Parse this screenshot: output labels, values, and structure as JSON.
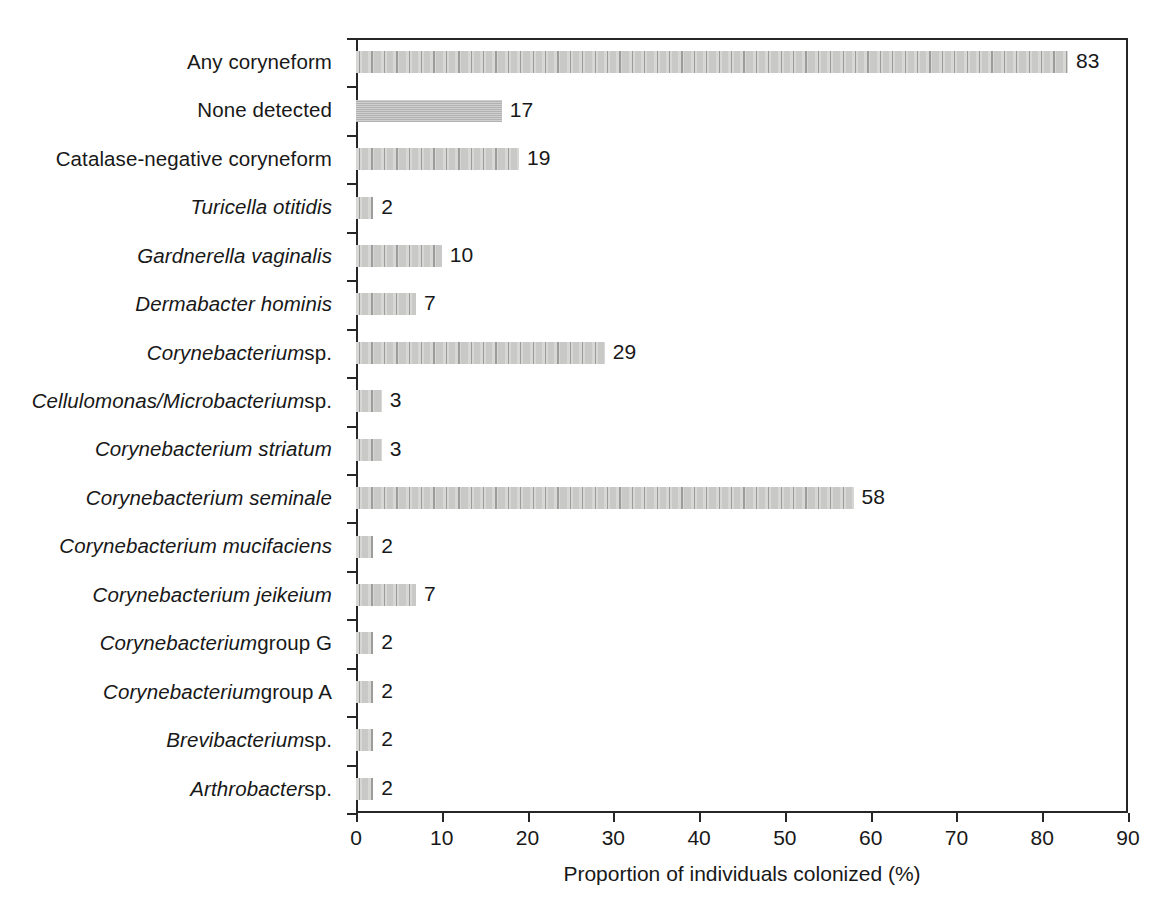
{
  "chart_data": {
    "type": "bar",
    "orientation": "horizontal",
    "title": "",
    "xlabel": "Proportion of individuals colonized (%)",
    "ylabel": "",
    "xlim": [
      0,
      90
    ],
    "xticks": [
      0,
      10,
      20,
      30,
      40,
      50,
      60,
      70,
      80,
      90
    ],
    "xtick_labels": [
      "0",
      "10",
      "20",
      "30",
      "40",
      "50",
      "60",
      "70",
      "80",
      "90"
    ],
    "grid": false,
    "legend": null,
    "bar_fill_color": "#c9c9c9",
    "bar_edge_color": "#8a8a8a",
    "axis_color": "#262626",
    "categories": [
      "Any coryneform",
      "None detected",
      "Catalase-negative coryneform",
      "Turicella otitidis",
      "Gardnerella vaginalis",
      "Dermabacter hominis",
      "Corynebacterium sp.",
      "Cellulomonas/Microbacterium sp.",
      "Corynebacterium striatum",
      "Corynebacterium seminale",
      "Corynebacterium mucifaciens",
      "Corynebacterium jeikeium",
      "Corynebacterium group G",
      "Corynebacterium group A",
      "Brevibacterium sp.",
      "Arthrobacter sp."
    ],
    "values": [
      83,
      17,
      19,
      2,
      10,
      7,
      29,
      3,
      3,
      58,
      2,
      7,
      2,
      2,
      2,
      2
    ],
    "value_labels": [
      "83",
      "17",
      "19",
      "2",
      "10",
      "7",
      "29",
      "3",
      "3",
      "58",
      "2",
      "7",
      "2",
      "2",
      "2",
      "2"
    ],
    "rows": [
      {
        "label_parts": [
          {
            "text": "Any coryneform",
            "style": "upright"
          }
        ],
        "value": 83,
        "value_label": "83",
        "pattern": "arrows"
      },
      {
        "label_parts": [
          {
            "text": "None detected",
            "style": "upright"
          }
        ],
        "value": 17,
        "value_label": "17",
        "pattern": "solid"
      },
      {
        "label_parts": [
          {
            "text": "Catalase-negative coryneform",
            "style": "upright"
          }
        ],
        "value": 19,
        "value_label": "19",
        "pattern": "arrows"
      },
      {
        "label_parts": [
          {
            "text": "Turicella otitidis",
            "style": "italic"
          }
        ],
        "value": 2,
        "value_label": "2",
        "pattern": "arrows"
      },
      {
        "label_parts": [
          {
            "text": "Gardnerella vaginalis",
            "style": "italic"
          }
        ],
        "value": 10,
        "value_label": "10",
        "pattern": "arrows"
      },
      {
        "label_parts": [
          {
            "text": "Dermabacter hominis",
            "style": "italic"
          }
        ],
        "value": 7,
        "value_label": "7",
        "pattern": "arrows"
      },
      {
        "label_parts": [
          {
            "text": "Corynebacterium ",
            "style": "italic"
          },
          {
            "text": "sp.",
            "style": "upright"
          }
        ],
        "value": 29,
        "value_label": "29",
        "pattern": "arrows"
      },
      {
        "label_parts": [
          {
            "text": "Cellulomonas/Microbacterium ",
            "style": "italic"
          },
          {
            "text": "sp.",
            "style": "upright"
          }
        ],
        "value": 3,
        "value_label": "3",
        "pattern": "arrows"
      },
      {
        "label_parts": [
          {
            "text": "Corynebacterium striatum",
            "style": "italic"
          }
        ],
        "value": 3,
        "value_label": "3",
        "pattern": "arrows"
      },
      {
        "label_parts": [
          {
            "text": "Corynebacterium seminale",
            "style": "italic"
          }
        ],
        "value": 58,
        "value_label": "58",
        "pattern": "arrows"
      },
      {
        "label_parts": [
          {
            "text": "Corynebacterium mucifaciens",
            "style": "italic"
          }
        ],
        "value": 2,
        "value_label": "2",
        "pattern": "arrows"
      },
      {
        "label_parts": [
          {
            "text": "Corynebacterium jeikeium",
            "style": "italic"
          }
        ],
        "value": 7,
        "value_label": "7",
        "pattern": "arrows"
      },
      {
        "label_parts": [
          {
            "text": "Corynebacterium ",
            "style": "italic"
          },
          {
            "text": "group G",
            "style": "upright"
          }
        ],
        "value": 2,
        "value_label": "2",
        "pattern": "arrows"
      },
      {
        "label_parts": [
          {
            "text": "Corynebacterium ",
            "style": "italic"
          },
          {
            "text": "group A",
            "style": "upright"
          }
        ],
        "value": 2,
        "value_label": "2",
        "pattern": "arrows"
      },
      {
        "label_parts": [
          {
            "text": "Brevibacterium ",
            "style": "italic"
          },
          {
            "text": "sp.",
            "style": "upright"
          }
        ],
        "value": 2,
        "value_label": "2",
        "pattern": "arrows"
      },
      {
        "label_parts": [
          {
            "text": "Arthrobacter ",
            "style": "italic"
          },
          {
            "text": "sp.",
            "style": "upright"
          }
        ],
        "value": 2,
        "value_label": "2",
        "pattern": "arrows"
      }
    ]
  }
}
